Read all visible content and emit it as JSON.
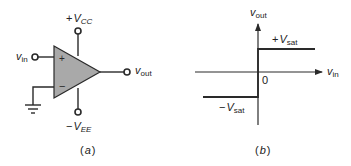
{
  "figure": {
    "panel_a": {
      "caption": "(a)",
      "caption_open": "(",
      "caption_letter": "a",
      "caption_close": ")",
      "component": "op-amp",
      "plus_supply": {
        "prefix": "+",
        "symbol": "V",
        "subscript": "CC"
      },
      "minus_supply": {
        "prefix": "−",
        "symbol": "V",
        "subscript": "EE"
      },
      "input": {
        "symbol": "v",
        "subscript": "in"
      },
      "output": {
        "symbol": "v",
        "subscript": "out"
      },
      "noninverting_mark": "+",
      "inverting_mark": "−",
      "inverting_input_connection": "ground"
    },
    "panel_b": {
      "caption": "(b)",
      "caption_open": "(",
      "caption_letter": "b",
      "caption_close": ")",
      "y_axis": {
        "symbol": "v",
        "subscript": "out"
      },
      "x_axis": {
        "symbol": "v",
        "subscript": "in"
      },
      "origin_label": "0",
      "upper_level": {
        "prefix": "+",
        "symbol": "V",
        "subscript": "sat"
      },
      "lower_level": {
        "prefix": "−",
        "symbol": "V",
        "subscript": "sat"
      }
    },
    "colors": {
      "line": "#2a2a2a",
      "triangle_fill": "#a9a9a9",
      "text": "#222222",
      "background": "#ffffff"
    }
  }
}
